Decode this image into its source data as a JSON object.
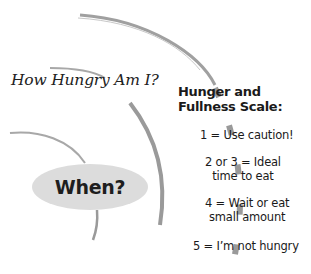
{
  "diagram": {
    "question": "How Hungry Am I?",
    "when_label": "When?",
    "scale": {
      "title_line1": "Hunger and",
      "title_line2": "Fullness Scale:",
      "items": [
        {
          "line1": "1 = Use caution!",
          "line2": ""
        },
        {
          "line1": "2 or 3 = Ideal",
          "line2": "time to eat"
        },
        {
          "line1": "4 = Wait or eat",
          "line2": "small amount"
        },
        {
          "line1": "5 = I’m not hungry",
          "line2": ""
        }
      ]
    },
    "colors": {
      "arc": "#9a9a9a",
      "bubble": "#dcdcdc",
      "text": "#1a1a1a"
    }
  }
}
